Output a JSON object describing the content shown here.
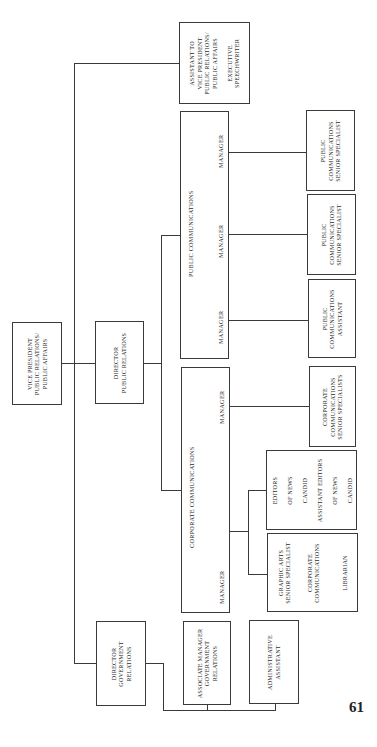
{
  "chart": {
    "vp": [
      "Vice President",
      "Public Relations/",
      "Public Affairs"
    ],
    "assistant": [
      "Assistant to",
      "Vice President",
      "Public Relations/",
      "Public Affairs",
      "",
      "Executive",
      "Speechwriter"
    ],
    "director_pr": [
      "Director",
      "Public Relations"
    ],
    "director_gov": [
      "Director",
      "Government",
      "Relations"
    ],
    "public_comms": {
      "title": "Public Communications",
      "manager_labels": [
        "Manager",
        "Manager",
        "Manager"
      ]
    },
    "corporate_comms": {
      "title": "Corporate Communications",
      "manager_labels": [
        "Manager",
        "Manager"
      ]
    },
    "pc_senior_1": [
      "Public",
      "Communications",
      "Senior Specialist"
    ],
    "pc_senior_2": [
      "Public",
      "Communications",
      "Senior Specialist"
    ],
    "pc_assistant": [
      "Public",
      "Communications",
      "Assistant"
    ],
    "cc_senior": [
      "Corporate",
      "Communications",
      "Senior Specialists"
    ],
    "editors": [
      "Editors",
      "of News",
      "Candid",
      "Assistant Editors",
      "of News",
      "Candid"
    ],
    "graphic_arts": [
      "Graphic Arts",
      "Senior Specialist",
      "",
      "Corporate",
      "Communications",
      "",
      "Librarian"
    ],
    "assoc_mgr": [
      "Associate Manager",
      "Government",
      "Relations"
    ],
    "admin": [
      "Administrative",
      "Assistant"
    ]
  },
  "page_number": "61"
}
